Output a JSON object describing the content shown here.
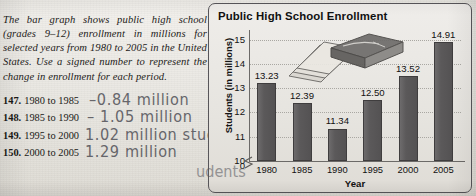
{
  "intro": {
    "text": "The bar graph shows public high school (grades 9–12) enrollment in millions for selected years from 1980 to 2005 in the United States. Use a signed number to represent the change in enrollment for each period."
  },
  "exercises": [
    {
      "number": "147.",
      "prompt": "1980 to 1985",
      "answer": "–0.84 million"
    },
    {
      "number": "148.",
      "prompt": "1985 to 1990",
      "answer": "– 1.05 million"
    },
    {
      "number": "149.",
      "prompt": "1995 to 2000",
      "answer": "1.02 million students"
    },
    {
      "number": "150.",
      "prompt": "2000 to 2005",
      "answer": "1.29 million"
    }
  ],
  "chart_data": {
    "type": "bar",
    "title": "Public High School Enrollment",
    "xlabel": "Year",
    "ylabel": "Students (in millions)",
    "categories": [
      "1980",
      "1985",
      "1990",
      "1995",
      "2000",
      "2005"
    ],
    "values": [
      13.23,
      12.39,
      11.34,
      12.5,
      13.52,
      14.91
    ],
    "value_labels": [
      "13.23",
      "12.39",
      "11.34",
      "12.50",
      "13.52",
      "14.91"
    ],
    "ytick_labels": [
      "15",
      "14",
      "13",
      "12",
      "11",
      "10",
      "0"
    ],
    "ylim": [
      10,
      15.4
    ],
    "axis_break": true,
    "grid": true,
    "legend": "none",
    "bar_color": "#5a5859",
    "panel_border_color": "#58565a"
  },
  "decor": {
    "book_illustration": "stack-of-books-illustration"
  }
}
